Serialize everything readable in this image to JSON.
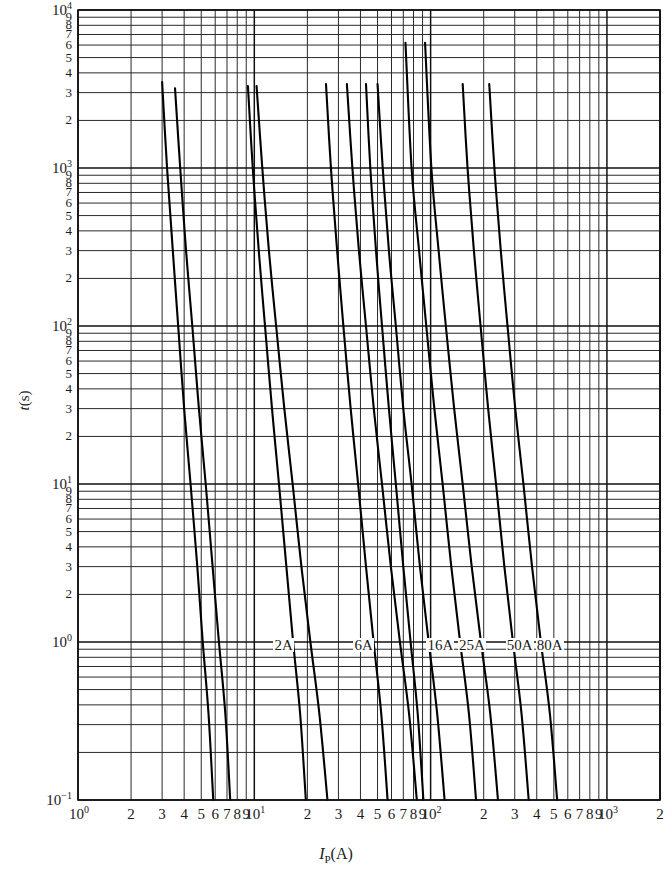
{
  "chart_data": {
    "type": "line",
    "title": "",
    "xlabel": "I_P(A)",
    "ylabel": "t(s)",
    "xscale": "log",
    "yscale": "log",
    "xlim": [
      1,
      2000
    ],
    "ylim": [
      0.1,
      10000
    ],
    "grid": true,
    "legend_position": "inline-labels",
    "x_decade_labels": [
      "10⁰",
      "10¹",
      "10²",
      "10³"
    ],
    "x_minor_labels": [
      "2",
      "3",
      "4",
      "5",
      "6",
      "7",
      "8",
      "9"
    ],
    "x_last_label": "2",
    "y_decade_labels": [
      "10⁴",
      "10³",
      "10²",
      "10¹",
      "10⁰",
      "10⁻¹"
    ],
    "y_minor_labels": [
      "9",
      "8",
      "7",
      "6",
      "5",
      "4",
      "3",
      "2"
    ],
    "annotations": [
      {
        "text": "2A",
        "x": 13,
        "y": 0.95
      },
      {
        "text": "6A",
        "x": 37,
        "y": 0.95
      },
      {
        "text": "16A",
        "x": 96,
        "y": 0.95
      },
      {
        "text": "25A",
        "x": 145,
        "y": 0.95
      },
      {
        "text": "50A",
        "x": 270,
        "y": 0.95
      },
      {
        "text": "80A",
        "x": 400,
        "y": 0.95
      }
    ],
    "series": [
      {
        "name": "2A min",
        "points": [
          [
            3.0,
            3500
          ],
          [
            3.2,
            1000
          ],
          [
            3.45,
            300
          ],
          [
            3.7,
            100
          ],
          [
            4.0,
            30
          ],
          [
            4.35,
            10
          ],
          [
            4.75,
            3
          ],
          [
            5.1,
            1
          ],
          [
            5.5,
            0.35
          ],
          [
            5.85,
            0.1
          ]
        ]
      },
      {
        "name": "2A max",
        "points": [
          [
            3.55,
            3200
          ],
          [
            3.8,
            1000
          ],
          [
            4.1,
            300
          ],
          [
            4.45,
            100
          ],
          [
            4.85,
            30
          ],
          [
            5.3,
            10
          ],
          [
            5.8,
            3
          ],
          [
            6.3,
            1
          ],
          [
            6.85,
            0.35
          ],
          [
            7.3,
            0.1
          ]
        ]
      },
      {
        "name": "6A min",
        "points": [
          [
            9.2,
            3300
          ],
          [
            9.8,
            1000
          ],
          [
            10.6,
            300
          ],
          [
            11.5,
            100
          ],
          [
            12.6,
            30
          ],
          [
            13.8,
            10
          ],
          [
            15.2,
            3
          ],
          [
            16.6,
            1
          ],
          [
            18.2,
            0.35
          ],
          [
            19.6,
            0.1
          ]
        ]
      },
      {
        "name": "6A max",
        "points": [
          [
            10.3,
            3300
          ],
          [
            11.1,
            1000
          ],
          [
            12.1,
            300
          ],
          [
            13.3,
            100
          ],
          [
            14.8,
            30
          ],
          [
            16.5,
            10
          ],
          [
            18.5,
            3
          ],
          [
            20.8,
            1
          ],
          [
            23.4,
            0.35
          ],
          [
            26.0,
            0.1
          ]
        ]
      },
      {
        "name": "16A min",
        "points": [
          [
            25.5,
            3400
          ],
          [
            27.2,
            1000
          ],
          [
            29.5,
            300
          ],
          [
            32.0,
            100
          ],
          [
            35.2,
            30
          ],
          [
            38.8,
            10
          ],
          [
            43.0,
            3
          ],
          [
            47.5,
            1
          ],
          [
            52.5,
            0.35
          ],
          [
            57.0,
            0.1
          ]
        ]
      },
      {
        "name": "16A max",
        "points": [
          [
            33.5,
            3400
          ],
          [
            36.0,
            1000
          ],
          [
            39.2,
            300
          ],
          [
            43.0,
            100
          ],
          [
            47.6,
            30
          ],
          [
            53.0,
            10
          ],
          [
            59.5,
            3
          ],
          [
            67.0,
            1
          ],
          [
            75.5,
            0.35
          ],
          [
            83.5,
            0.1
          ]
        ]
      },
      {
        "name": "25A min",
        "points": [
          [
            43.0,
            3400
          ],
          [
            45.5,
            1000
          ],
          [
            49.0,
            300
          ],
          [
            53.0,
            100
          ],
          [
            58.0,
            30
          ],
          [
            63.5,
            10
          ],
          [
            70.0,
            3
          ],
          [
            77.0,
            1
          ],
          [
            84.5,
            0.35
          ],
          [
            91.0,
            0.1
          ]
        ]
      },
      {
        "name": "25A max",
        "points": [
          [
            50.0,
            3400
          ],
          [
            53.5,
            1000
          ],
          [
            58.0,
            300
          ],
          [
            63.5,
            100
          ],
          [
            70.0,
            30
          ],
          [
            78.0,
            10
          ],
          [
            87.0,
            3
          ],
          [
            97.5,
            1
          ],
          [
            109.0,
            0.35
          ],
          [
            120.0,
            0.1
          ]
        ]
      },
      {
        "name": "50A min",
        "points": [
          [
            72.0,
            6200
          ],
          [
            78.0,
            1000
          ],
          [
            86.0,
            300
          ],
          [
            94.5,
            100
          ],
          [
            105.0,
            30
          ],
          [
            117.0,
            10
          ],
          [
            131.0,
            3
          ],
          [
            147.0,
            1
          ],
          [
            165.0,
            0.35
          ],
          [
            181.0,
            0.1
          ]
        ]
      },
      {
        "name": "50A max",
        "points": [
          [
            93.0,
            6200
          ],
          [
            101.0,
            1000
          ],
          [
            111.0,
            300
          ],
          [
            122.0,
            100
          ],
          [
            136.0,
            30
          ],
          [
            152.0,
            10
          ],
          [
            171.0,
            3
          ],
          [
            193.0,
            1
          ],
          [
            218.0,
            0.35
          ],
          [
            241.0,
            0.1
          ]
        ]
      },
      {
        "name": "80A min",
        "points": [
          [
            152.0,
            3400
          ],
          [
            162.0,
            1000
          ],
          [
            176.0,
            300
          ],
          [
            192.0,
            100
          ],
          [
            212.0,
            30
          ],
          [
            235.0,
            10
          ],
          [
            262.0,
            3
          ],
          [
            293.0,
            1
          ],
          [
            328.0,
            0.35
          ],
          [
            360.0,
            0.1
          ]
        ]
      },
      {
        "name": "80A max",
        "points": [
          [
            215.0,
            3400
          ],
          [
            230.0,
            1000
          ],
          [
            250.0,
            300
          ],
          [
            273.0,
            100
          ],
          [
            302.0,
            30
          ],
          [
            336.0,
            10
          ],
          [
            376.0,
            3
          ],
          [
            422.0,
            1
          ],
          [
            475.0,
            0.35
          ],
          [
            522.0,
            0.1
          ]
        ]
      }
    ]
  },
  "axes": {
    "ylabel_base": "t",
    "ylabel_unit": "(s)",
    "xlabel_sym": "I",
    "xlabel_sub": "P",
    "xlabel_unit": "(A)"
  }
}
